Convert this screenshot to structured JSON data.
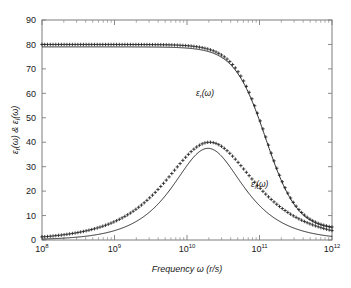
{
  "chart_data": {
    "type": "line",
    "title": "",
    "xlabel": "Frequency ω (r/s)",
    "ylabel": "εr(ω) & εi(ω)",
    "xscale": "log",
    "xlim": [
      100000000.0,
      1000000000000.0
    ],
    "ylim": [
      0,
      90
    ],
    "ytick_values": [
      0,
      10,
      20,
      30,
      40,
      50,
      60,
      70,
      80,
      90
    ],
    "ytick_labels": [
      "0",
      "10",
      "20",
      "30",
      "40",
      "50",
      "60",
      "70",
      "80",
      "90"
    ],
    "xtick_values": [
      100000000.0,
      1000000000.0,
      10000000000.0,
      100000000000.0,
      1000000000000.0
    ],
    "xtick_labels": [
      "10^8",
      "10^9",
      "10^10",
      "10^11",
      "10^12"
    ],
    "xtick_mantissa": [
      "10",
      "10",
      "10",
      "10",
      "10"
    ],
    "xtick_exponents": [
      "8",
      "9",
      "10",
      "11",
      "12"
    ],
    "grid": false,
    "legend": "none",
    "annotations": [
      {
        "name": "epsilon-real-label",
        "base": "ε",
        "subscript": "r",
        "suffix": "(ω)",
        "x_px": 196,
        "y_px": 96
      },
      {
        "name": "epsilon-imag-label",
        "base": "ε",
        "subscript": "i",
        "suffix": "(ω)",
        "x_px": 251,
        "y_px": 187
      }
    ],
    "series": [
      {
        "name": "epsilon_r model (solid line)",
        "style": "solid-line",
        "color": "#2a2a2a",
        "description": "Real part of permittivity, Debye relaxation, static value 79, high-frequency value ~4",
        "model": "debye_real",
        "eps_static": 79.0,
        "eps_inf": 4.0,
        "tau_s": 8.2e-12,
        "x": [
          100000000.0,
          316000000.0,
          1000000000.0,
          3160000000.0,
          6000000000.0,
          10000000000.0,
          15000000000.0,
          20000000000.0,
          30000000000.0,
          50000000000.0,
          80000000000.0,
          100000000000.0,
          200000000000.0,
          500000000000.0,
          1000000000000.0
        ],
        "y": [
          79.0,
          79.0,
          78.7,
          76.5,
          71.0,
          62.0,
          50.5,
          42.0,
          30.0,
          18.0,
          11.5,
          9.6,
          6.0,
          4.3,
          4.0
        ]
      },
      {
        "name": "epsilon_r measured (plus markers)",
        "style": "plus-markers",
        "color": "#222222",
        "description": "Real part data points, plateau at 80, decaying to ~4.5",
        "model": "debye_real",
        "eps_static": 80.0,
        "eps_inf": 4.2,
        "tau_s": 8.2e-12,
        "x": [
          100000000.0,
          316000000.0,
          1000000000.0,
          3160000000.0,
          6000000000.0,
          10000000000.0,
          15000000000.0,
          20000000000.0,
          30000000000.0,
          50000000000.0,
          80000000000.0,
          100000000000.0,
          200000000000.0,
          500000000000.0,
          1000000000000.0
        ],
        "y": [
          80.0,
          80.0,
          79.7,
          77.5,
          72.0,
          63.0,
          51.5,
          43.0,
          31.0,
          18.8,
          12.2,
          10.2,
          6.4,
          4.6,
          4.3
        ]
      },
      {
        "name": "epsilon_i model (solid line)",
        "style": "solid-line",
        "color": "#2a2a2a",
        "description": "Imaginary part of permittivity, peak ~37.5 near 2e10 r/s, falling to ~3 at 1e12",
        "model": "debye_imag",
        "peak_value": 37.5,
        "peak_frequency": 19500000000.0,
        "x": [
          100000000.0,
          316000000.0,
          1000000000.0,
          3160000000.0,
          6000000000.0,
          10000000000.0,
          15000000000.0,
          19500000000.0,
          30000000000.0,
          50000000000.0,
          80000000000.0,
          100000000000.0,
          200000000000.0,
          500000000000.0,
          1000000000000.0
        ],
        "y": [
          0.3,
          1.0,
          3.1,
          9.4,
          16.5,
          24.5,
          33.0,
          37.5,
          35.5,
          27.0,
          19.5,
          16.5,
          9.5,
          4.2,
          2.9
        ]
      },
      {
        "name": "epsilon_i measured (plus markers)",
        "style": "plus-markers",
        "color": "#222222",
        "description": "Imaginary part data points, peak ~40 near 2e10 r/s with broader high-frequency tail",
        "model": "debye_imag_broad",
        "peak_value": 40.0,
        "peak_frequency": 20500000000.0,
        "x": [
          100000000.0,
          316000000.0,
          1000000000.0,
          3160000000.0,
          6000000000.0,
          10000000000.0,
          15000000000.0,
          20500000000.0,
          30000000000.0,
          50000000000.0,
          80000000000.0,
          100000000000.0,
          200000000000.0,
          500000000000.0,
          1000000000000.0
        ],
        "y": [
          0.4,
          1.1,
          3.3,
          9.8,
          17.2,
          25.5,
          34.5,
          40.0,
          38.5,
          31.5,
          25.0,
          22.0,
          14.5,
          7.2,
          4.6
        ]
      }
    ]
  }
}
